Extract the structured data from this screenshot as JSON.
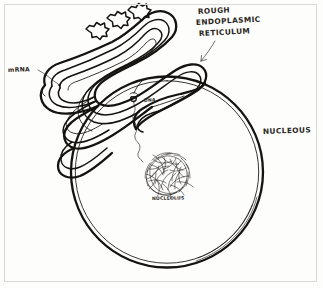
{
  "figure": {
    "medium": "pencil sketch on white paper",
    "ink_color": "#15130f",
    "paper_color": "#fdfdfc",
    "frame_color": "#d8d8d8"
  },
  "labels": {
    "rer_line1": "ROUGH",
    "rer_line2": "ENDOPLASMIC",
    "rer_line3": "RETICULUM",
    "mrna": "mRNA",
    "dna": "DNA",
    "nucleus": "NUCLEOUS",
    "nucleolus": "NUCLEOLUS"
  },
  "parts": {
    "rough_er": "rough-endoplasmic-reticulum",
    "ribosomes": "ribosome",
    "ribosome_count": 3,
    "nuclear_envelope": "nuclear-envelope",
    "nucleolus": "nucleolus",
    "dna_strand": "dna-strand",
    "mrna_strand": "mrna-strand",
    "nuclear_pore": "nuclear-pore"
  }
}
